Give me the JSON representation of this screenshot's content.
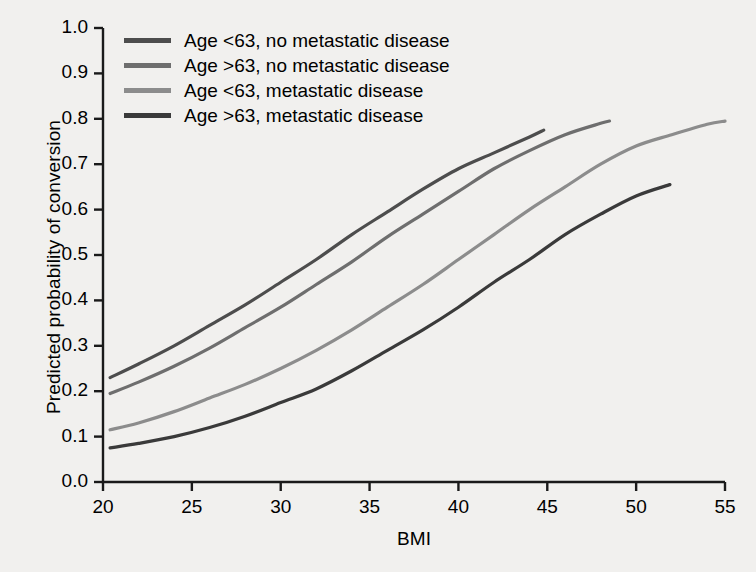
{
  "chart_data": {
    "type": "line",
    "title": "",
    "xlabel": "BMI",
    "ylabel": "Predicted probability of conversion",
    "xlim": [
      20,
      55
    ],
    "ylim": [
      0.0,
      1.0
    ],
    "xticks": [
      "20",
      "25",
      "30",
      "35",
      "40",
      "45",
      "50",
      "55"
    ],
    "yticks": [
      "0.0",
      "0.1",
      "0.2",
      "0.3",
      "0.4",
      "0.5",
      "0.6",
      "0.7",
      "0.8",
      "0.9",
      "1.0"
    ],
    "grid": false,
    "legend_position": "upper-left",
    "background_color": "#f1f0ee",
    "frame_color": "#1a1a1a",
    "series": [
      {
        "name": "Age <63, no metastatic disease",
        "color": "#4d4d4d",
        "x": [
          20.4,
          22,
          24,
          26,
          28,
          30,
          32,
          34,
          36,
          38,
          40,
          42,
          44,
          44.8
        ],
        "y": [
          0.23,
          0.26,
          0.3,
          0.345,
          0.39,
          0.44,
          0.49,
          0.545,
          0.595,
          0.645,
          0.69,
          0.725,
          0.76,
          0.775
        ]
      },
      {
        "name": "Age >63, no metastatic disease",
        "color": "#6e6e6e",
        "x": [
          20.4,
          22,
          24,
          26,
          28,
          30,
          32,
          34,
          36,
          38,
          40,
          42,
          44,
          46,
          48,
          48.5
        ],
        "y": [
          0.195,
          0.22,
          0.255,
          0.295,
          0.34,
          0.385,
          0.435,
          0.485,
          0.54,
          0.59,
          0.64,
          0.69,
          0.73,
          0.765,
          0.79,
          0.795
        ]
      },
      {
        "name": "Age <63, metastatic disease",
        "color": "#8c8c8c",
        "x": [
          20.4,
          22,
          24,
          26,
          28,
          30,
          32,
          34,
          36,
          38,
          40,
          42,
          44,
          46,
          48,
          50,
          52,
          54,
          55
        ],
        "y": [
          0.115,
          0.13,
          0.155,
          0.185,
          0.215,
          0.25,
          0.29,
          0.335,
          0.385,
          0.435,
          0.49,
          0.545,
          0.6,
          0.65,
          0.7,
          0.74,
          0.765,
          0.788,
          0.795
        ]
      },
      {
        "name": "Age >63, metastatic disease",
        "color": "#3a3a3a",
        "x": [
          20.4,
          22,
          24,
          26,
          28,
          30,
          32,
          34,
          36,
          38,
          40,
          42,
          44,
          46,
          48,
          50,
          51.9
        ],
        "y": [
          0.075,
          0.085,
          0.1,
          0.12,
          0.145,
          0.175,
          0.205,
          0.245,
          0.29,
          0.335,
          0.385,
          0.44,
          0.49,
          0.545,
          0.59,
          0.63,
          0.655
        ]
      }
    ]
  },
  "legend": {
    "items": [
      {
        "label": "Age <63, no metastatic disease",
        "color": "#4d4d4d"
      },
      {
        "label": "Age >63, no metastatic disease",
        "color": "#6e6e6e"
      },
      {
        "label": "Age <63, metastatic disease",
        "color": "#8c8c8c"
      },
      {
        "label": "Age >63, metastatic disease",
        "color": "#3a3a3a"
      }
    ]
  }
}
